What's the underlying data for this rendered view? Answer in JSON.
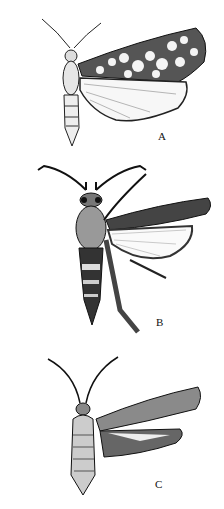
{
  "figure": {
    "panels": [
      {
        "label": "A",
        "subject": "moth with checkered dark forewing and pale hindwing"
      },
      {
        "label": "B",
        "subject": "clearwing-type moth with hairy legs and banded abdomen"
      },
      {
        "label": "C",
        "subject": "slender moth with speckled forewing and fringed hindwing"
      }
    ]
  },
  "colors": {
    "ink": "#111111",
    "paper": "#ffffff"
  }
}
